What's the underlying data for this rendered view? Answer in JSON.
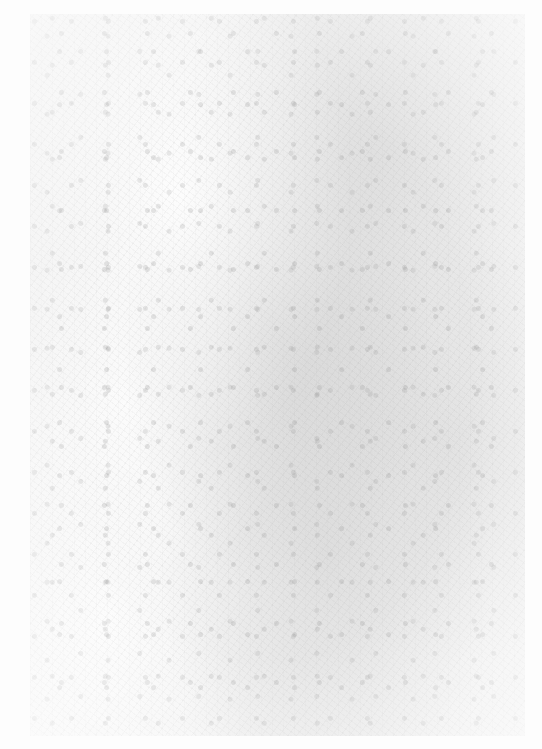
{
  "image": {
    "description": "Faded, low-contrast grayscale scan of a printed plate or engraving; no legible text or distinct features",
    "colors": {
      "paper": "#fdfdfd",
      "plate_tone": "#f1f1f1",
      "speckle": "#a0a0a0"
    }
  }
}
